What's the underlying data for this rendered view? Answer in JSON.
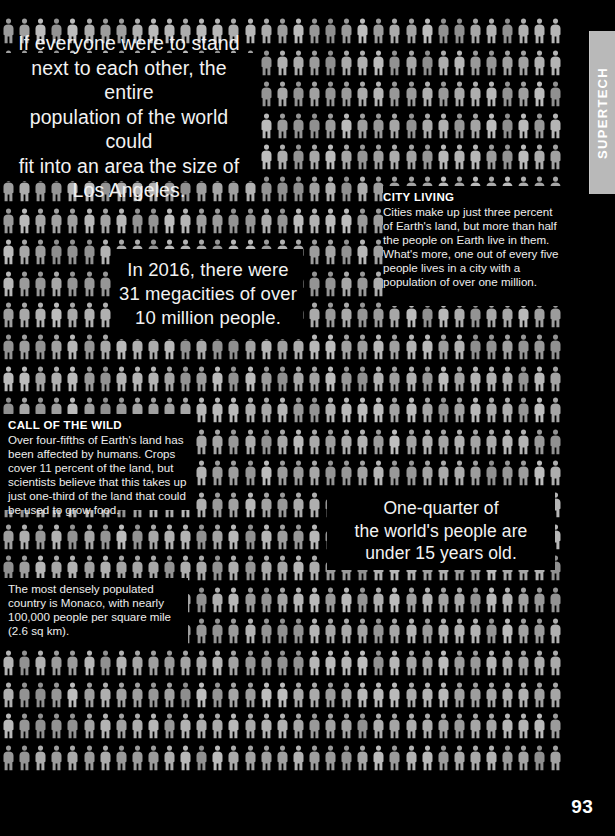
{
  "page": {
    "number": "93",
    "background_color": "#000000",
    "figure_color": "#a8a8a8"
  },
  "side_tab": {
    "label": "SUPERTECH",
    "background_color": "#b9b9b9",
    "text_color": "#ffffff"
  },
  "callouts": [
    {
      "id": "los-angeles",
      "lines": [
        "If everyone were to stand",
        "next to each other, the entire",
        "population of the world could",
        "fit into an area the size of",
        "Los Angeles."
      ]
    },
    {
      "id": "megacities",
      "lines": [
        "In 2016, there were",
        "31 megacities of over",
        "10 million people."
      ]
    },
    {
      "id": "one-quarter",
      "lines": [
        "One-quarter of",
        "the world's people are",
        "under 15 years old."
      ]
    }
  ],
  "text_blocks": {
    "city_living": {
      "heading": "CITY LIVING",
      "body": "Cities make up just three percent of Earth's land, but more than half the people on Earth live in them. What's more, one out of every five people lives in a city with a population of over one million."
    },
    "call_of_the_wild": {
      "heading": "CALL OF THE WILD",
      "body": "Over four-fifths of Earth's land has been affected by humans. Crops cover 11 percent of the land, but scientists believe that this takes up just one-third of the land that could be used to grow food."
    },
    "monaco": {
      "heading": "",
      "body": "The most densely populated country is Monaco, with nearly 100,000 people per square mile (2.6 sq km)."
    }
  },
  "grid": {
    "icon_name": "person-pictogram",
    "columns": 35,
    "rows": 25,
    "col_pitch": 16.1,
    "row_pitch": 31.6,
    "origin_x": 2,
    "origin_y": 18,
    "right_edge": 562,
    "bottom_edge": 792
  }
}
